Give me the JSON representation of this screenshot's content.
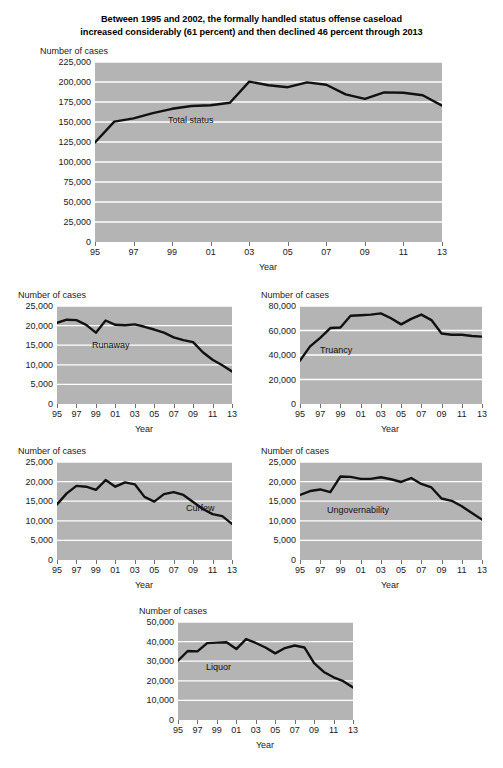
{
  "figure": {
    "title_line1": "Between 1995 and 2002, the formally handled status offense caseload",
    "title_line2": "increased considerably (61 percent) and then declined 46 percent through 2013",
    "axis_y_caption": "Number of cases",
    "axis_x_caption": "Year",
    "plot_background": "#b4b4b4",
    "gridline_color": "#ffffff",
    "line_color": "#111111"
  },
  "chart_data": [
    {
      "id": "total-status",
      "type": "line",
      "title": "Between 1995 and 2002, the formally handled status offense caseload increased considerably (61 percent) and then declined 46 percent through 2013",
      "xlabel": "Year",
      "ylabel": "Number of cases",
      "series_label": "Total status",
      "x": [
        1995,
        1996,
        1997,
        1998,
        1999,
        2000,
        2001,
        2002,
        2003,
        2004,
        2005,
        2006,
        2007,
        2008,
        2009,
        2010,
        2011,
        2012,
        2013
      ],
      "values": [
        124500,
        150500,
        154500,
        161000,
        166500,
        170000,
        171000,
        174000,
        200500,
        196000,
        193500,
        199500,
        196500,
        184500,
        179000,
        187000,
        186500,
        183500,
        170500
      ],
      "ylim": [
        0,
        225000
      ],
      "yticks": [
        "0",
        "25,000",
        "50,000",
        "75,000",
        "100,000",
        "125,000",
        "150,000",
        "175,000",
        "200,000",
        "225,000"
      ],
      "ytick_values": [
        0,
        25000,
        50000,
        75000,
        100000,
        125000,
        150000,
        175000,
        200000,
        225000
      ],
      "xticks": [
        "95",
        "97",
        "99",
        "01",
        "03",
        "05",
        "07",
        "09",
        "11",
        "13"
      ],
      "xtick_values": [
        1995,
        1997,
        1999,
        2001,
        2003,
        2005,
        2007,
        2009,
        2011,
        2013
      ],
      "grid": true,
      "note": "Values continue: 2009-2013 decline to about 110,000"
    },
    {
      "id": "runaway",
      "type": "line",
      "series_label": "Runaway",
      "xlabel": "Year",
      "ylabel": "Number of cases",
      "x": [
        1995,
        1996,
        1997,
        1998,
        1999,
        2000,
        2001,
        2002,
        2003,
        2004,
        2005,
        2006,
        2007,
        2008,
        2009,
        2010,
        2011,
        2012,
        2013
      ],
      "values": [
        20700,
        21500,
        21400,
        20200,
        18200,
        21300,
        20200,
        20100,
        20300,
        19700,
        19000,
        18200,
        17000,
        16300,
        15800,
        13200,
        11300,
        9900,
        8300
      ],
      "ylim": [
        0,
        25000
      ],
      "yticks": [
        "0",
        "5,000",
        "10,000",
        "15,000",
        "20,000",
        "25,000"
      ],
      "ytick_values": [
        0,
        5000,
        10000,
        15000,
        20000,
        25000
      ],
      "xticks": [
        "95",
        "97",
        "99",
        "01",
        "03",
        "05",
        "07",
        "09",
        "11",
        "13"
      ],
      "xtick_values": [
        1995,
        1997,
        1999,
        2001,
        2003,
        2005,
        2007,
        2009,
        2011,
        2013
      ],
      "grid": true
    },
    {
      "id": "truancy",
      "type": "line",
      "series_label": "Truancy",
      "xlabel": "Year",
      "ylabel": "Number of cases",
      "x": [
        1995,
        1996,
        1997,
        1998,
        1999,
        2000,
        2001,
        2002,
        2003,
        2004,
        2005,
        2006,
        2007,
        2008,
        2009,
        2010,
        2011,
        2012,
        2013
      ],
      "values": [
        35500,
        47000,
        54000,
        62000,
        62500,
        72000,
        72500,
        73000,
        74000,
        70000,
        65000,
        69500,
        73000,
        68500,
        57500,
        56500,
        56500,
        55500,
        55000
      ],
      "ylim": [
        0,
        80000
      ],
      "yticks": [
        "0",
        "20,000",
        "40,000",
        "60,000",
        "80,000"
      ],
      "ytick_values": [
        0,
        20000,
        40000,
        60000,
        80000
      ],
      "xticks": [
        "95",
        "97",
        "99",
        "01",
        "03",
        "05",
        "07",
        "09",
        "11",
        "13"
      ],
      "xtick_values": [
        1995,
        1997,
        1999,
        2001,
        2003,
        2005,
        2007,
        2009,
        2011,
        2013
      ],
      "grid": true
    },
    {
      "id": "curfew",
      "type": "line",
      "series_label": "Curfew",
      "xlabel": "Year",
      "ylabel": "Number of cases",
      "x": [
        1995,
        1996,
        1997,
        1998,
        1999,
        2000,
        2001,
        2002,
        2003,
        2004,
        2005,
        2006,
        2007,
        2008,
        2009,
        2010,
        2011,
        2012,
        2013
      ],
      "values": [
        14200,
        17000,
        18900,
        18700,
        17900,
        20400,
        18700,
        19800,
        19300,
        16100,
        14900,
        16800,
        17300,
        16600,
        14800,
        13000,
        11700,
        11200,
        9200
      ],
      "ylim": [
        0,
        25000
      ],
      "yticks": [
        "0",
        "5,000",
        "10,000",
        "15,000",
        "20,000",
        "25,000"
      ],
      "ytick_values": [
        0,
        5000,
        10000,
        15000,
        20000,
        25000
      ],
      "xticks": [
        "95",
        "97",
        "99",
        "01",
        "03",
        "05",
        "07",
        "09",
        "11",
        "13"
      ],
      "xtick_values": [
        1995,
        1997,
        1999,
        2001,
        2003,
        2005,
        2007,
        2009,
        2011,
        2013
      ],
      "grid": true
    },
    {
      "id": "ungovernability",
      "type": "line",
      "series_label": "Ungovernability",
      "xlabel": "Year",
      "ylabel": "Number of cases",
      "x": [
        1995,
        1996,
        1997,
        1998,
        1999,
        2000,
        2001,
        2002,
        2003,
        2004,
        2005,
        2006,
        2007,
        2008,
        2009,
        2010,
        2011,
        2012,
        2013
      ],
      "values": [
        16600,
        17600,
        18000,
        17300,
        21300,
        21200,
        20700,
        20700,
        21100,
        20600,
        19900,
        20900,
        19400,
        18500,
        15700,
        15100,
        13700,
        12000,
        10300
      ],
      "ylim": [
        0,
        25000
      ],
      "yticks": [
        "0",
        "5,000",
        "10,000",
        "15,000",
        "20,000",
        "25,000"
      ],
      "ytick_values": [
        0,
        5000,
        10000,
        15000,
        20000,
        25000
      ],
      "xticks": [
        "95",
        "97",
        "99",
        "01",
        "03",
        "05",
        "07",
        "09",
        "11",
        "13"
      ],
      "xtick_values": [
        1995,
        1997,
        1999,
        2001,
        2003,
        2005,
        2007,
        2009,
        2011,
        2013
      ],
      "grid": true
    },
    {
      "id": "liquor",
      "type": "line",
      "series_label": "Liquor",
      "xlabel": "Year",
      "ylabel": "Number of cases",
      "x": [
        1995,
        1996,
        1997,
        1998,
        1999,
        2000,
        2001,
        2002,
        2003,
        2004,
        2005,
        2006,
        2007,
        2008,
        2009,
        2010,
        2011,
        2012,
        2013
      ],
      "values": [
        30300,
        35200,
        35000,
        39200,
        39500,
        39700,
        36200,
        41300,
        39300,
        37000,
        34000,
        36700,
        38000,
        37000,
        29000,
        24500,
        21800,
        19800,
        16600
      ],
      "ylim": [
        0,
        50000
      ],
      "yticks": [
        "0",
        "10,000",
        "20,000",
        "30,000",
        "40,000",
        "50,000"
      ],
      "ytick_values": [
        0,
        10000,
        20000,
        30000,
        40000,
        50000
      ],
      "xticks": [
        "95",
        "97",
        "99",
        "01",
        "03",
        "05",
        "07",
        "09",
        "11",
        "13"
      ],
      "xtick_values": [
        1995,
        1997,
        1999,
        2001,
        2003,
        2005,
        2007,
        2009,
        2011,
        2013
      ],
      "grid": true
    }
  ],
  "panels": [
    {
      "id": "total-status",
      "y_caption": "Number of cases",
      "x_caption": "Year",
      "series_label": "Total status"
    },
    {
      "id": "runaway",
      "y_caption": "Number of cases",
      "x_caption": "Year",
      "series_label": "Runaway"
    },
    {
      "id": "truancy",
      "y_caption": "Number of cases",
      "x_caption": "Year",
      "series_label": "Truancy"
    },
    {
      "id": "curfew",
      "y_caption": "Number of cases",
      "x_caption": "Year",
      "series_label": "Curfew"
    },
    {
      "id": "ungovernability",
      "y_caption": "Number of cases",
      "x_caption": "Year",
      "series_label": "Ungovernability"
    },
    {
      "id": "liquor",
      "y_caption": "Number of cases",
      "x_caption": "Year",
      "series_label": "Liquor"
    }
  ]
}
